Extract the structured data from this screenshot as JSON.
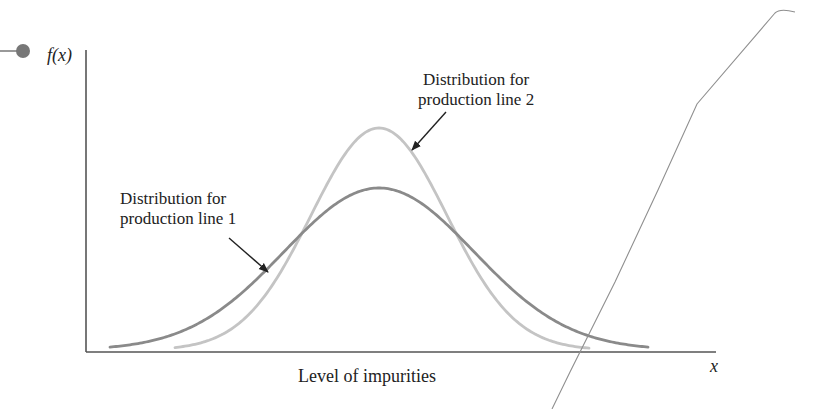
{
  "chart_data": {
    "type": "line",
    "title": "",
    "xlabel": "Level of impurities",
    "ylabel": "f(x)",
    "x_axis_symbol": "x",
    "grid": false,
    "legend_position": "annotations",
    "series": [
      {
        "name": "Distribution for production line 1",
        "label_line1": "Distribution for",
        "label_line2": "production line 1",
        "color": "#8a8a8a",
        "shape": "normal",
        "mean_px": 379,
        "peak_height_relative": 0.54,
        "spread": "wider"
      },
      {
        "name": "Distribution for production line 2",
        "label_line1": "Distribution for",
        "label_line2": "production line 2",
        "color": "#c4c4c4",
        "shape": "normal",
        "mean_px": 379,
        "peak_height_relative": 0.74,
        "spread": "narrower"
      }
    ],
    "annotations": [
      "Distribution for production line 1",
      "Distribution for production line 2"
    ]
  }
}
